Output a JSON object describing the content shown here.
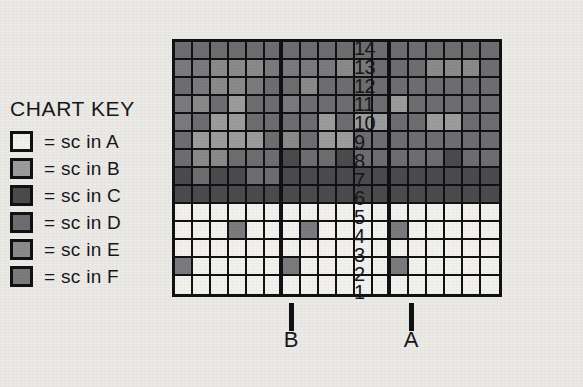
{
  "key": {
    "title": "CHART KEY",
    "entries": [
      {
        "code": "A",
        "label": "= sc in A",
        "color": "#f2f1ee",
        "swatch_name": "key-swatch-a"
      },
      {
        "code": "B",
        "label": "= sc in B",
        "color": "#9c9c9c",
        "swatch_name": "key-swatch-b"
      },
      {
        "code": "C",
        "label": "= sc in C",
        "color": "#4b4b4d",
        "swatch_name": "key-swatch-c"
      },
      {
        "code": "D",
        "label": "= sc in D",
        "color": "#6e6e70",
        "swatch_name": "key-swatch-d"
      },
      {
        "code": "E",
        "label": "= sc in E",
        "color": "#8a8a8a",
        "swatch_name": "key-swatch-e"
      },
      {
        "code": "F",
        "label": "= sc in F",
        "color": "#7b7b7d",
        "swatch_name": "key-swatch-f"
      }
    ]
  },
  "grid": {
    "columns": 18,
    "rows": 14,
    "row_labels": [
      "14",
      "13",
      "12",
      "11",
      "10",
      "9",
      "8",
      "7",
      "6",
      "5",
      "4",
      "3",
      "2",
      "1"
    ],
    "thick_divider_after_columns": [
      6,
      12
    ],
    "grid_line_color": "#111114",
    "cells": [
      [
        "D",
        "D",
        "D",
        "D",
        "D",
        "D",
        "D",
        "D",
        "D",
        "D",
        "D",
        "D",
        "D",
        "D",
        "D",
        "D",
        "D",
        "D"
      ],
      [
        "F",
        "F",
        "E",
        "E",
        "E",
        "F",
        "F",
        "F",
        "F",
        "E",
        "F",
        "D",
        "D",
        "D",
        "E",
        "E",
        "E",
        "D"
      ],
      [
        "D",
        "F",
        "E",
        "E",
        "F",
        "D",
        "D",
        "E",
        "D",
        "D",
        "D",
        "D",
        "D",
        "D",
        "D",
        "D",
        "D",
        "D"
      ],
      [
        "F",
        "E",
        "D",
        "B",
        "D",
        "D",
        "F",
        "D",
        "D",
        "D",
        "D",
        "D",
        "B",
        "D",
        "D",
        "D",
        "D",
        "D"
      ],
      [
        "F",
        "D",
        "B",
        "B",
        "D",
        "D",
        "D",
        "D",
        "B",
        "D",
        "B",
        "B",
        "D",
        "D",
        "B",
        "B",
        "D",
        "D"
      ],
      [
        "D",
        "B",
        "B",
        "B",
        "B",
        "D",
        "E",
        "D",
        "B",
        "B",
        "D",
        "D",
        "D",
        "D",
        "D",
        "D",
        "D",
        "D"
      ],
      [
        "D",
        "E",
        "E",
        "D",
        "D",
        "D",
        "C",
        "D",
        "D",
        "C",
        "D",
        "D",
        "D",
        "D",
        "D",
        "C",
        "D",
        "D"
      ],
      [
        "C",
        "D",
        "C",
        "C",
        "D",
        "D",
        "C",
        "C",
        "C",
        "C",
        "C",
        "C",
        "C",
        "C",
        "C",
        "C",
        "C",
        "C"
      ],
      [
        "C",
        "C",
        "C",
        "C",
        "C",
        "C",
        "C",
        "C",
        "C",
        "C",
        "C",
        "C",
        "C",
        "C",
        "C",
        "C",
        "C",
        "C"
      ],
      [
        "A",
        "A",
        "A",
        "A",
        "A",
        "A",
        "A",
        "A",
        "A",
        "A",
        "A",
        "A",
        "A",
        "A",
        "A",
        "A",
        "A",
        "A"
      ],
      [
        "A",
        "A",
        "A",
        "F",
        "A",
        "A",
        "A",
        "F",
        "A",
        "A",
        "A",
        "A",
        "F",
        "A",
        "A",
        "A",
        "A",
        "A"
      ],
      [
        "A",
        "A",
        "A",
        "A",
        "A",
        "A",
        "A",
        "A",
        "A",
        "A",
        "A",
        "A",
        "A",
        "A",
        "A",
        "A",
        "A",
        "A"
      ],
      [
        "F",
        "A",
        "A",
        "A",
        "A",
        "A",
        "F",
        "A",
        "A",
        "A",
        "A",
        "A",
        "F",
        "A",
        "A",
        "A",
        "A",
        "A"
      ],
      [
        "A",
        "A",
        "A",
        "A",
        "A",
        "A",
        "A",
        "A",
        "A",
        "A",
        "A",
        "A",
        "A",
        "A",
        "A",
        "A",
        "A",
        "A"
      ]
    ]
  },
  "markers": [
    {
      "label": "B",
      "after_column": 6,
      "name": "section-marker-b"
    },
    {
      "label": "A",
      "after_column": 12,
      "name": "section-marker-a"
    }
  ]
}
